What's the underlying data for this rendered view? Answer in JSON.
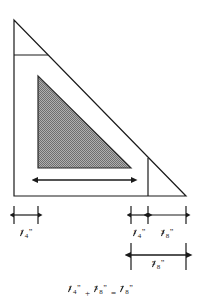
{
  "figure": {
    "type": "technical-drawing",
    "colors": {
      "line": "#1a1a1a",
      "shade_fill": "#8c8c8c",
      "background": "#ffffff"
    },
    "outer_triangle": {
      "apex": [
        14,
        20
      ],
      "bottom_left": [
        14,
        196
      ],
      "bottom_right": [
        186,
        196
      ]
    },
    "inner_shaded_triangle": {
      "apex": [
        38,
        76
      ],
      "bottom_left": [
        38,
        168
      ],
      "bottom_right": [
        131,
        168
      ]
    },
    "guide_lines": [
      {
        "name": "top-horizontal-guide",
        "x1": 14,
        "y1": 55,
        "x2": 48,
        "y2": 55
      },
      {
        "name": "right-vertical-guide",
        "x1": 148,
        "y1": 158,
        "x2": 148,
        "y2": 196
      }
    ],
    "width_arrow": {
      "x1": 38,
      "x2": 131,
      "y": 180
    }
  },
  "dimensions": {
    "left_seam": {
      "label_numerator": "1",
      "label_denominator": "4",
      "inch_mark": "”",
      "tick_left_x": 14,
      "tick_right_x": 38,
      "label_x": 26,
      "value": "1/4\""
    },
    "right_seam": {
      "label_numerator": "1",
      "label_denominator": "4",
      "inch_mark": "”",
      "tick_left_x": 131,
      "tick_right_x": 148,
      "label_x": 139,
      "value": "1/4\""
    },
    "right_extra": {
      "label_numerator": "3",
      "label_denominator": "8",
      "inch_mark": "”",
      "tick_left_x": 148,
      "tick_right_x": 186,
      "label_x": 167,
      "value": "3/8\""
    },
    "total_right": {
      "label_numerator": "5",
      "label_denominator": "8",
      "inch_mark": "”",
      "tick_left_x": 131,
      "tick_right_x": 186,
      "label_x": 158,
      "value": "5/8\""
    }
  },
  "equation": {
    "term1": {
      "numerator": "1",
      "denominator": "4",
      "inch_mark": "”"
    },
    "plus": "+",
    "term2": {
      "numerator": "5",
      "denominator": "8",
      "inch_mark": "”"
    },
    "equals": "=",
    "result": {
      "numerator": "7",
      "denominator": "8",
      "inch_mark": "”"
    },
    "text": "1/4\" + 5/8\" = 7/8\""
  }
}
